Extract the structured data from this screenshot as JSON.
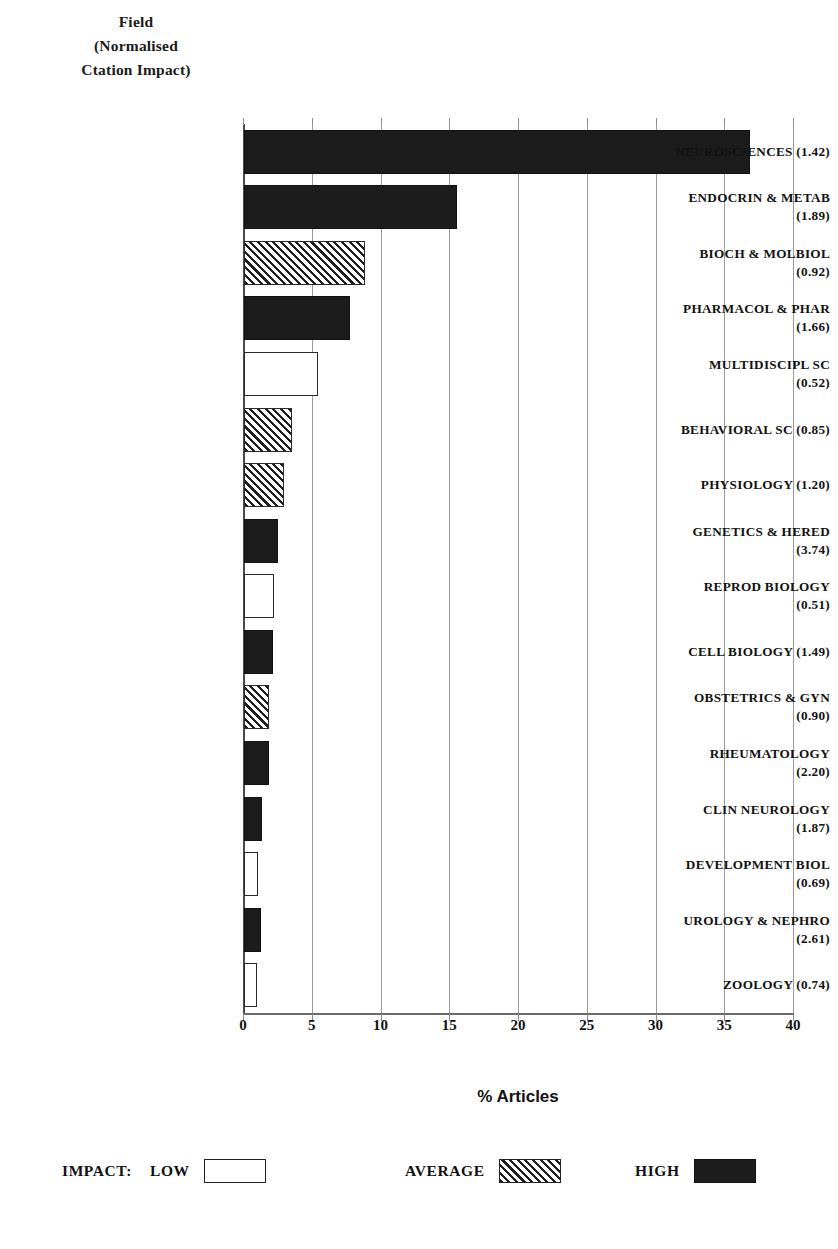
{
  "axis_title": {
    "line1": "Field",
    "line2": "(Normalised",
    "line3": "Ctation Impact)"
  },
  "chart_data": {
    "type": "bar",
    "orientation": "horizontal",
    "title": "",
    "xlabel": "% Articles",
    "ylabel": "Field (Normalised Ctation Impact)",
    "xlim": [
      0,
      40
    ],
    "xticks": [
      "0",
      "5",
      "10",
      "15",
      "20",
      "25",
      "30",
      "35",
      "40"
    ],
    "grid": true,
    "legend_position": "bottom",
    "categories": [
      "NEUROSCIENCES  (1.42)",
      "ENDOCRIN & METAB (1.89)",
      "BIOCH & MOLBIOL (0.92)",
      "PHARMACOL & PHAR (1.66)",
      "MULTIDISCIPL SC (0.52)",
      "BEHAVIORAL SC  (0.85)",
      "PHYSIOLOGY  (1.20)",
      "GENETICS & HERED (3.74)",
      "REPROD BIOLOGY (0.51)",
      "CELL BIOLOGY  (1.49)",
      "OBSTETRICS & GYN (0.90)",
      "RHEUMATOLOGY (2.20)",
      "CLIN NEUROLOGY (1.87)",
      "DEVELOPMENT BIOL (0.69)",
      "UROLOGY & NEPHRO (2.61)",
      "ZOOLOGY  (0.74)"
    ],
    "values": [
      36.8,
      15.5,
      8.8,
      7.7,
      5.4,
      3.5,
      2.9,
      2.5,
      2.2,
      2.1,
      1.8,
      1.8,
      1.3,
      1.0,
      1.2,
      0.95
    ],
    "impacts": [
      "high",
      "high",
      "average",
      "high",
      "low",
      "average",
      "average",
      "high",
      "low",
      "high",
      "average",
      "high",
      "high",
      "low",
      "high",
      "low"
    ],
    "bars": [
      {
        "label_line1": "NEUROSCIENCES  (1.42)",
        "label_line2": "",
        "field": "NEUROSCIENCES",
        "nci": "1.42",
        "value": 36.8,
        "impact": "high"
      },
      {
        "label_line1": "ENDOCRIN & METAB",
        "label_line2": "(1.89)",
        "field": "ENDOCRIN & METAB",
        "nci": "1.89",
        "value": 15.5,
        "impact": "high"
      },
      {
        "label_line1": "BIOCH & MOLBIOL",
        "label_line2": "(0.92)",
        "field": "BIOCH & MOLBIOL",
        "nci": "0.92",
        "value": 8.8,
        "impact": "average"
      },
      {
        "label_line1": "PHARMACOL & PHAR",
        "label_line2": "(1.66)",
        "field": "PHARMACOL & PHAR",
        "nci": "1.66",
        "value": 7.7,
        "impact": "high"
      },
      {
        "label_line1": "MULTIDISCIPL SC",
        "label_line2": "(0.52)",
        "field": "MULTIDISCIPL SC",
        "nci": "0.52",
        "value": 5.4,
        "impact": "low"
      },
      {
        "label_line1": "BEHAVIORAL SC  (0.85)",
        "label_line2": "",
        "field": "BEHAVIORAL SC",
        "nci": "0.85",
        "value": 3.5,
        "impact": "average"
      },
      {
        "label_line1": "PHYSIOLOGY  (1.20)",
        "label_line2": "",
        "field": "PHYSIOLOGY",
        "nci": "1.20",
        "value": 2.9,
        "impact": "average"
      },
      {
        "label_line1": "GENETICS & HERED",
        "label_line2": "(3.74)",
        "field": "GENETICS & HERED",
        "nci": "3.74",
        "value": 2.5,
        "impact": "high"
      },
      {
        "label_line1": "REPROD BIOLOGY",
        "label_line2": "(0.51)",
        "field": "REPROD BIOLOGY",
        "nci": "0.51",
        "value": 2.2,
        "impact": "low"
      },
      {
        "label_line1": "CELL BIOLOGY  (1.49)",
        "label_line2": "",
        "field": "CELL BIOLOGY",
        "nci": "1.49",
        "value": 2.1,
        "impact": "high"
      },
      {
        "label_line1": "OBSTETRICS & GYN",
        "label_line2": "(0.90)",
        "field": "OBSTETRICS & GYN",
        "nci": "0.90",
        "value": 1.8,
        "impact": "average"
      },
      {
        "label_line1": "RHEUMATOLOGY",
        "label_line2": "(2.20)",
        "field": "RHEUMATOLOGY",
        "nci": "2.20",
        "value": 1.8,
        "impact": "high"
      },
      {
        "label_line1": "CLIN NEUROLOGY",
        "label_line2": "(1.87)",
        "field": "CLIN NEUROLOGY",
        "nci": "1.87",
        "value": 1.3,
        "impact": "high"
      },
      {
        "label_line1": "DEVELOPMENT BIOL",
        "label_line2": "(0.69)",
        "field": "DEVELOPMENT BIOL",
        "nci": "0.69",
        "value": 1.0,
        "impact": "low"
      },
      {
        "label_line1": "UROLOGY & NEPHRO",
        "label_line2": "(2.61)",
        "field": "UROLOGY & NEPHRO",
        "nci": "2.61",
        "value": 1.2,
        "impact": "high"
      },
      {
        "label_line1": "ZOOLOGY  (0.74)",
        "label_line2": "",
        "field": "ZOOLOGY",
        "nci": "0.74",
        "value": 0.95,
        "impact": "low"
      }
    ],
    "legend": {
      "title": "IMPACT:",
      "entries": [
        {
          "label": "LOW",
          "style": "low"
        },
        {
          "label": "AVERAGE",
          "style": "average"
        },
        {
          "label": "HIGH",
          "style": "high"
        }
      ]
    }
  },
  "colors": {
    "high_fill": "#1c1c1c",
    "low_fill": "#ffffff",
    "hatch_line": "#1f1f1f",
    "outline": "#222222",
    "gridline": "#9a9a9a",
    "text": "#111111",
    "background": "#ffffff"
  }
}
